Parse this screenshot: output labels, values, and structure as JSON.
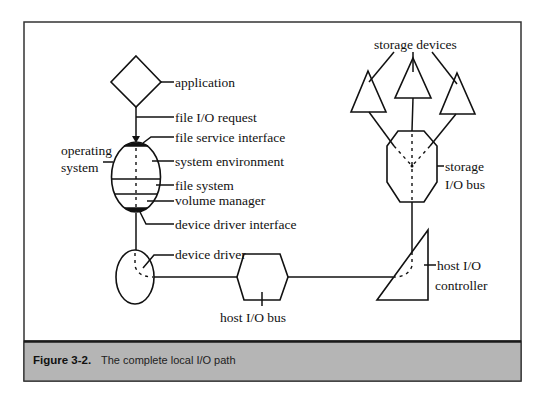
{
  "figure": {
    "number": "Figure 3-2.",
    "caption": "The complete local I/O path",
    "colors": {
      "frame": "#333333",
      "caption_band": "#b5b5b5",
      "ink": "#111111"
    }
  },
  "labels": {
    "application": "application",
    "file_io_request": "file I/O request",
    "file_service_interface": "file service interface",
    "operating_system_line1": "operating",
    "operating_system_line2": "system",
    "system_environment": "system  environment",
    "file_system": "file system",
    "volume_manager": "volume manager",
    "device_driver_interface": "device driver interface",
    "device_driver": "device driver",
    "host_io_bus": "host I/O bus",
    "host_io_controller_line1": "host I/O",
    "host_io_controller_line2": "controller",
    "storage_devices": "storage devices",
    "storage_io_bus_line1": "storage",
    "storage_io_bus_line2": "I/O bus"
  },
  "nodes": [
    {
      "id": "application",
      "shape": "diamond"
    },
    {
      "id": "operating-system",
      "shape": "ellipse",
      "layers": [
        "file service interface",
        "system environment",
        "file system",
        "volume manager",
        "device driver interface"
      ]
    },
    {
      "id": "device-driver",
      "shape": "ellipse"
    },
    {
      "id": "host-io-bus",
      "shape": "hexagon"
    },
    {
      "id": "host-io-controller",
      "shape": "right-triangle"
    },
    {
      "id": "storage-io-bus",
      "shape": "octagon"
    },
    {
      "id": "storage-device-1",
      "shape": "triangle"
    },
    {
      "id": "storage-device-2",
      "shape": "triangle"
    },
    {
      "id": "storage-device-3",
      "shape": "triangle"
    }
  ],
  "edges": [
    {
      "from": "application",
      "to": "operating-system",
      "label": "file I/O request",
      "arrow": true
    },
    {
      "from": "operating-system",
      "to": "device-driver"
    },
    {
      "from": "device-driver",
      "to": "host-io-bus"
    },
    {
      "from": "host-io-bus",
      "to": "host-io-controller"
    },
    {
      "from": "host-io-controller",
      "to": "storage-io-bus"
    },
    {
      "from": "storage-io-bus",
      "to": "storage-device-1"
    },
    {
      "from": "storage-io-bus",
      "to": "storage-device-2"
    },
    {
      "from": "storage-io-bus",
      "to": "storage-device-3"
    }
  ]
}
